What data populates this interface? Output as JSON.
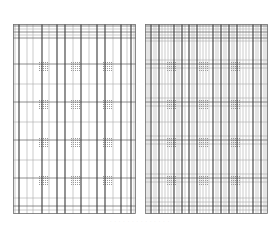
{
  "figure": {
    "caption": "· · · · · · · · · · · · · ·",
    "colors": {
      "line_dark": "#3a3a3a",
      "line_mid": "#6e6e6e",
      "line_light": "#a8a8a8",
      "hatch": "#9a9a9a"
    },
    "panels": [
      {
        "id": "left",
        "label": "sparse grid",
        "v_dark": [
          6,
          29,
          44,
          52,
          68,
          84,
          92,
          108,
          118
        ],
        "v_light": [
          2,
          14,
          20,
          36,
          60,
          76,
          100,
          114,
          121
        ],
        "h_dark": [
          2,
          8,
          14,
          40,
          78,
          116,
          154,
          182
        ],
        "h_light": [
          5,
          11,
          60,
          98,
          136,
          174,
          186
        ],
        "hatches": [
          [
            26,
            38
          ],
          [
            58,
            38
          ],
          [
            90,
            38
          ],
          [
            26,
            76
          ],
          [
            58,
            76
          ],
          [
            90,
            76
          ],
          [
            26,
            114
          ],
          [
            58,
            114
          ],
          [
            90,
            114
          ],
          [
            26,
            152
          ],
          [
            58,
            152
          ],
          [
            90,
            152
          ]
        ]
      },
      {
        "id": "right",
        "label": "dense grid",
        "v_dark": [
          6,
          14,
          29,
          37,
          44,
          52,
          68,
          76,
          84,
          92,
          108,
          116
        ],
        "v_light": [
          2,
          4,
          9,
          11,
          17,
          20,
          23,
          26,
          32,
          34,
          40,
          47,
          49,
          55,
          58,
          61,
          64,
          71,
          73,
          79,
          81,
          87,
          89,
          95,
          98,
          101,
          104,
          111,
          113,
          119,
          121
        ],
        "h_dark": [
          2,
          8,
          14,
          40,
          78,
          116,
          154,
          182
        ],
        "h_light": [
          5,
          11,
          17,
          36,
          44,
          60,
          74,
          82,
          98,
          112,
          120,
          136,
          150,
          158,
          174,
          178,
          186
        ],
        "hatches": [
          [
            22,
            38
          ],
          [
            54,
            38
          ],
          [
            86,
            38
          ],
          [
            22,
            76
          ],
          [
            54,
            76
          ],
          [
            86,
            76
          ],
          [
            22,
            114
          ],
          [
            54,
            114
          ],
          [
            86,
            114
          ],
          [
            22,
            152
          ],
          [
            54,
            152
          ],
          [
            86,
            152
          ]
        ]
      }
    ]
  }
}
